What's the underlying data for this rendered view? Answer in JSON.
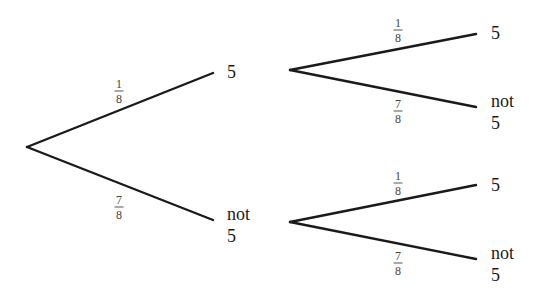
{
  "diagram": {
    "type": "probability-tree",
    "line_color": "#1a1a1a",
    "level1": {
      "upper": {
        "prob_num": "1",
        "prob_den": "8",
        "outcome_line1": "5"
      },
      "lower": {
        "prob_num": "7",
        "prob_den": "8",
        "outcome_line1": "not",
        "outcome_line2": "5"
      }
    },
    "level2_from_5": {
      "upper": {
        "prob_num": "1",
        "prob_den": "8",
        "outcome_line1": "5"
      },
      "lower": {
        "prob_num": "7",
        "prob_den": "8",
        "outcome_line1": "not",
        "outcome_line2": "5"
      }
    },
    "level2_from_not5": {
      "upper": {
        "prob_num": "1",
        "prob_den": "8",
        "outcome_line1": "5"
      },
      "lower": {
        "prob_num": "7",
        "prob_den": "8",
        "outcome_line1": "not",
        "outcome_line2": "5"
      }
    }
  }
}
